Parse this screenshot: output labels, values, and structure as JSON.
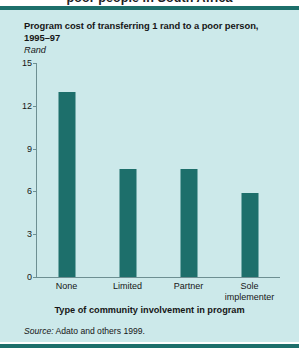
{
  "page": {
    "clipped_heading_above": "poor people in South Africa"
  },
  "figure": {
    "title": "Program cost of transferring 1 rand to a poor person, 1995–97",
    "source_prefix": "Source:",
    "source_text": "Adato and others 1999.",
    "colors": {
      "panel_background": "#cce9ea",
      "bar": "#1d6f6b",
      "rule": "#1d6f6b",
      "axis": "#6d8f92",
      "text": "#161616"
    }
  },
  "chart_data": {
    "type": "bar",
    "title": "Program cost of transferring 1 rand to a poor person, 1995–97",
    "subtitle": "",
    "categories": [
      "None",
      "Limited",
      "Partner",
      "Sole implementer"
    ],
    "category_lines": [
      [
        "None"
      ],
      [
        "Limited"
      ],
      [
        "Partner"
      ],
      [
        "Sole",
        "implementer"
      ]
    ],
    "values": [
      13.0,
      7.6,
      7.6,
      5.9
    ],
    "xlabel": "Type of community involvement in program",
    "ylabel": "Rand",
    "ylim": [
      0,
      15
    ],
    "yticks": [
      0,
      3,
      6,
      9,
      12,
      15
    ],
    "ytick_labels": [
      "0",
      "3",
      "6",
      "9",
      "12",
      "15"
    ],
    "grid": false,
    "legend": "none",
    "series": [
      {
        "name": "Program cost (rand)",
        "values": [
          13.0,
          7.6,
          7.6,
          5.9
        ]
      }
    ]
  }
}
